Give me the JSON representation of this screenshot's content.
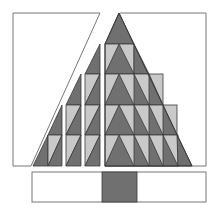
{
  "diagram": {
    "colors": {
      "background": "#ffffff",
      "frame_stroke": "#777777",
      "dark_fill": "#707070",
      "light_fill": "#c9c9c9",
      "edge_stroke": "#3a3a3a"
    },
    "frames": [
      {
        "name": "left-frame",
        "points": "13,13 100,13 31,166 13,166"
      },
      {
        "name": "right-frame",
        "points": "120,13 206,13 206,166 192,166 120,13"
      },
      {
        "name": "bottom-bar",
        "x": 32,
        "y": 172,
        "width": 174,
        "height": 30
      }
    ],
    "trunk": {
      "x": 102,
      "y": 172,
      "width": 35,
      "height": 30,
      "fill": "#707070"
    },
    "main_triangle": {
      "apex": [
        119,
        13
      ],
      "left_x": 105,
      "base_y": 166,
      "right_x": 192,
      "rows": 5
    },
    "columns": [
      {
        "name": "column-1",
        "x1": 33,
        "x2": 62,
        "top_y": 105
      },
      {
        "name": "column-2",
        "x1": 66,
        "x2": 81,
        "top_y": 74
      },
      {
        "name": "column-3",
        "x1": 85,
        "x2": 100,
        "top_y": 44
      }
    ]
  }
}
